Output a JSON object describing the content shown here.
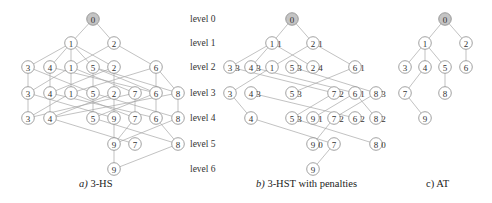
{
  "captions": {
    "a": {
      "letter": "a)",
      "text": " 3-HS"
    },
    "b": {
      "letter": "b)",
      "text": " 3-HST with penalties"
    },
    "c": {
      "letter": "c)",
      "text": " AT"
    }
  },
  "level_labels": [
    "level 0",
    "level 1",
    "level 2",
    "level 3",
    "level 4",
    "level 5",
    "level 6"
  ],
  "level_y": [
    19,
    43,
    67,
    93,
    118,
    144,
    169
  ],
  "colors": {
    "root_fill": "#c4c4c4",
    "node_stroke": "#8a8a8a",
    "edge": "#a8a8a8"
  },
  "panels": [
    {
      "id": "a",
      "nodes": [
        {
          "id": "a0",
          "label": "0",
          "x": 93,
          "lv": 0,
          "root": true
        },
        {
          "id": "a1_1",
          "label": "1",
          "x": 71,
          "lv": 1
        },
        {
          "id": "a1_2",
          "label": "2",
          "x": 114,
          "lv": 1
        },
        {
          "id": "a2_3",
          "label": "3",
          "x": 28,
          "lv": 2
        },
        {
          "id": "a2_4",
          "label": "4",
          "x": 50,
          "lv": 2
        },
        {
          "id": "a2_1",
          "label": "1",
          "x": 71,
          "lv": 2
        },
        {
          "id": "a2_5",
          "label": "5",
          "x": 93,
          "lv": 2
        },
        {
          "id": "a2_2",
          "label": "2",
          "x": 114,
          "lv": 2
        },
        {
          "id": "a2_6",
          "label": "6",
          "x": 156,
          "lv": 2
        },
        {
          "id": "a3_3",
          "label": "3",
          "x": 28,
          "lv": 3
        },
        {
          "id": "a3_4",
          "label": "4",
          "x": 50,
          "lv": 3
        },
        {
          "id": "a3_1",
          "label": "1",
          "x": 71,
          "lv": 3
        },
        {
          "id": "a3_5",
          "label": "5",
          "x": 93,
          "lv": 3
        },
        {
          "id": "a3_2",
          "label": "2",
          "x": 114,
          "lv": 3
        },
        {
          "id": "a3_7",
          "label": "7",
          "x": 135,
          "lv": 3
        },
        {
          "id": "a3_6",
          "label": "6",
          "x": 156,
          "lv": 3
        },
        {
          "id": "a3_8",
          "label": "8",
          "x": 178,
          "lv": 3
        },
        {
          "id": "a4_3",
          "label": "3",
          "x": 28,
          "lv": 4
        },
        {
          "id": "a4_4",
          "label": "4",
          "x": 50,
          "lv": 4
        },
        {
          "id": "a4_5",
          "label": "5",
          "x": 93,
          "lv": 4
        },
        {
          "id": "a4_9",
          "label": "9",
          "x": 114,
          "lv": 4
        },
        {
          "id": "a4_7",
          "label": "7",
          "x": 135,
          "lv": 4
        },
        {
          "id": "a4_6",
          "label": "6",
          "x": 156,
          "lv": 4
        },
        {
          "id": "a4_8",
          "label": "8",
          "x": 178,
          "lv": 4
        },
        {
          "id": "a5_9",
          "label": "9",
          "x": 114,
          "lv": 5
        },
        {
          "id": "a5_7",
          "label": "7",
          "x": 135,
          "lv": 5
        },
        {
          "id": "a5_8",
          "label": "8",
          "x": 178,
          "lv": 5
        },
        {
          "id": "a6_9",
          "label": "9",
          "x": 114,
          "lv": 6
        }
      ],
      "edges": [
        [
          "a0",
          "a1_1"
        ],
        [
          "a0",
          "a1_2"
        ],
        [
          "a1_1",
          "a2_3"
        ],
        [
          "a1_1",
          "a2_4"
        ],
        [
          "a1_1",
          "a2_1"
        ],
        [
          "a1_1",
          "a2_5"
        ],
        [
          "a1_1",
          "a2_2"
        ],
        [
          "a1_2",
          "a2_1"
        ],
        [
          "a1_2",
          "a2_6"
        ],
        [
          "a2_3",
          "a3_3"
        ],
        [
          "a2_3",
          "a3_5"
        ],
        [
          "a2_4",
          "a3_4"
        ],
        [
          "a2_4",
          "a3_6"
        ],
        [
          "a2_1",
          "a3_1"
        ],
        [
          "a2_1",
          "a3_3"
        ],
        [
          "a2_1",
          "a3_7"
        ],
        [
          "a2_5",
          "a3_5"
        ],
        [
          "a2_5",
          "a3_8"
        ],
        [
          "a2_2",
          "a3_2"
        ],
        [
          "a2_2",
          "a3_4"
        ],
        [
          "a2_6",
          "a3_6"
        ],
        [
          "a2_6",
          "a3_1"
        ],
        [
          "a2_6",
          "a3_8"
        ],
        [
          "a2_5",
          "a3_6"
        ],
        [
          "a3_3",
          "a4_3"
        ],
        [
          "a3_3",
          "a4_9"
        ],
        [
          "a3_4",
          "a4_4"
        ],
        [
          "a3_4",
          "a4_6"
        ],
        [
          "a3_1",
          "a4_3"
        ],
        [
          "a3_1",
          "a4_7"
        ],
        [
          "a3_5",
          "a4_5"
        ],
        [
          "a3_5",
          "a4_8"
        ],
        [
          "a3_2",
          "a4_4"
        ],
        [
          "a3_2",
          "a4_9"
        ],
        [
          "a3_7",
          "a4_7"
        ],
        [
          "a3_7",
          "a4_3"
        ],
        [
          "a3_6",
          "a4_6"
        ],
        [
          "a3_6",
          "a4_5"
        ],
        [
          "a3_8",
          "a4_8"
        ],
        [
          "a3_8",
          "a4_4"
        ],
        [
          "a4_4",
          "a5_7"
        ],
        [
          "a4_5",
          "a5_8"
        ],
        [
          "a4_9",
          "a5_9"
        ],
        [
          "a4_7",
          "a5_9"
        ],
        [
          "a4_6",
          "a5_8"
        ],
        [
          "a4_8",
          "a5_9"
        ],
        [
          "a5_9",
          "a6_9"
        ],
        [
          "a5_8",
          "a6_9"
        ]
      ]
    },
    {
      "id": "b",
      "nodes": [
        {
          "id": "b0",
          "label": "0",
          "x": 292,
          "lv": 0,
          "root": true
        },
        {
          "id": "b1_1",
          "label": "1",
          "x": 272,
          "lv": 1,
          "pen": "1"
        },
        {
          "id": "b1_2",
          "label": "2",
          "x": 313,
          "lv": 1,
          "pen": "1"
        },
        {
          "id": "b2_3",
          "label": "3",
          "x": 230,
          "lv": 2,
          "pen": "3"
        },
        {
          "id": "b2_4",
          "label": "4",
          "x": 251,
          "lv": 2,
          "pen": "3"
        },
        {
          "id": "b2_1",
          "label": "1",
          "x": 272,
          "lv": 2
        },
        {
          "id": "b2_5",
          "label": "5",
          "x": 292,
          "lv": 2,
          "pen": "3"
        },
        {
          "id": "b2_2",
          "label": "2",
          "x": 313,
          "lv": 2,
          "pen": "4"
        },
        {
          "id": "b2_6",
          "label": "6",
          "x": 355,
          "lv": 2,
          "pen": "1"
        },
        {
          "id": "b3_3",
          "label": "3",
          "x": 230,
          "lv": 3
        },
        {
          "id": "b3_4",
          "label": "4",
          "x": 251,
          "lv": 3,
          "pen": "3"
        },
        {
          "id": "b3_5",
          "label": "5",
          "x": 292,
          "lv": 3,
          "pen": "3"
        },
        {
          "id": "b3_7",
          "label": "7",
          "x": 334,
          "lv": 3,
          "pen": "2"
        },
        {
          "id": "b3_6",
          "label": "6",
          "x": 355,
          "lv": 3,
          "pen": "1"
        },
        {
          "id": "b3_8",
          "label": "8",
          "x": 376,
          "lv": 3,
          "pen": "3"
        },
        {
          "id": "b4_4",
          "label": "4",
          "x": 251,
          "lv": 4
        },
        {
          "id": "b4_5",
          "label": "5",
          "x": 292,
          "lv": 4,
          "pen": "3"
        },
        {
          "id": "b4_9",
          "label": "9",
          "x": 313,
          "lv": 4,
          "pen": "1"
        },
        {
          "id": "b4_7",
          "label": "7",
          "x": 334,
          "lv": 4,
          "pen": "2"
        },
        {
          "id": "b4_6",
          "label": "6",
          "x": 355,
          "lv": 4,
          "pen": "2"
        },
        {
          "id": "b4_8",
          "label": "8",
          "x": 376,
          "lv": 4,
          "pen": "2"
        },
        {
          "id": "b5_9",
          "label": "9",
          "x": 313,
          "lv": 5,
          "pen": "0"
        },
        {
          "id": "b5_7",
          "label": "7",
          "x": 334,
          "lv": 5
        },
        {
          "id": "b5_8",
          "label": "8",
          "x": 376,
          "lv": 5,
          "pen": "0"
        },
        {
          "id": "b6_9",
          "label": "9",
          "x": 313,
          "lv": 6
        }
      ],
      "edges": [
        [
          "b0",
          "b1_1"
        ],
        [
          "b0",
          "b1_2"
        ],
        [
          "b1_1",
          "b2_3"
        ],
        [
          "b1_1",
          "b2_4"
        ],
        [
          "b1_1",
          "b2_2"
        ],
        [
          "b1_2",
          "b2_1"
        ],
        [
          "b1_2",
          "b2_6"
        ],
        [
          "b2_1",
          "b3_3"
        ],
        [
          "b2_3",
          "b3_7"
        ],
        [
          "b2_4",
          "b3_6"
        ],
        [
          "b2_5",
          "b3_8"
        ],
        [
          "b2_6",
          "b3_5"
        ],
        [
          "b3_3",
          "b4_4"
        ],
        [
          "b3_4",
          "b4_6"
        ],
        [
          "b3_7",
          "b4_5"
        ],
        [
          "b3_6",
          "b4_9"
        ],
        [
          "b3_6",
          "b4_8"
        ],
        [
          "b3_8",
          "b4_7"
        ],
        [
          "b4_4",
          "b5_7"
        ],
        [
          "b4_5",
          "b5_8"
        ],
        [
          "b4_7",
          "b5_9"
        ],
        [
          "b5_7",
          "b6_9"
        ]
      ]
    },
    {
      "id": "c",
      "nodes": [
        {
          "id": "c0",
          "label": "0",
          "x": 445,
          "lv": 0,
          "root": true
        },
        {
          "id": "c1_1",
          "label": "1",
          "x": 425,
          "lv": 1
        },
        {
          "id": "c1_2",
          "label": "2",
          "x": 466,
          "lv": 1
        },
        {
          "id": "c2_3",
          "label": "3",
          "x": 405,
          "lv": 2
        },
        {
          "id": "c2_4",
          "label": "4",
          "x": 425,
          "lv": 2
        },
        {
          "id": "c2_5",
          "label": "5",
          "x": 445,
          "lv": 2
        },
        {
          "id": "c2_6",
          "label": "6",
          "x": 466,
          "lv": 2
        },
        {
          "id": "c3_7",
          "label": "7",
          "x": 405,
          "lv": 3
        },
        {
          "id": "c3_8",
          "label": "8",
          "x": 445,
          "lv": 3
        },
        {
          "id": "c4_9",
          "label": "9",
          "x": 425,
          "lv": 4
        }
      ],
      "edges": [
        [
          "c0",
          "c1_1"
        ],
        [
          "c0",
          "c1_2"
        ],
        [
          "c1_1",
          "c2_3"
        ],
        [
          "c1_1",
          "c2_4"
        ],
        [
          "c1_1",
          "c2_5"
        ],
        [
          "c1_2",
          "c2_6"
        ],
        [
          "c2_4",
          "c3_7"
        ],
        [
          "c2_5",
          "c3_8"
        ],
        [
          "c3_7",
          "c4_9"
        ]
      ]
    }
  ]
}
